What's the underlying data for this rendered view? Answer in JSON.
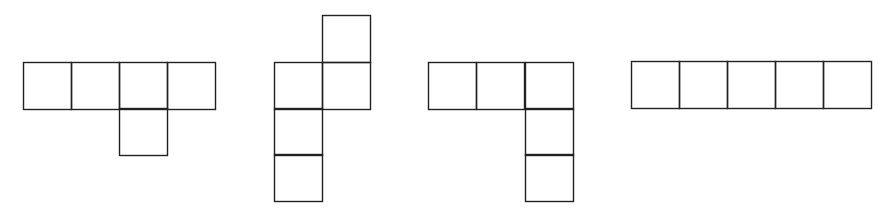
{
  "diagram": {
    "title": "",
    "stroke_color": "#222222",
    "background": "#ffffff",
    "cell_size": 48,
    "figures": [
      {
        "id": "figure-1",
        "shape": "row of four with one square below third",
        "cells": [
          [
            23,
            62
          ],
          [
            71,
            62
          ],
          [
            119,
            62
          ],
          [
            167,
            62
          ],
          [
            119,
            108
          ]
        ]
      },
      {
        "id": "figure-2",
        "shape": "stepped column: top square offset right, then two side by side, then two below left",
        "cells": [
          [
            322,
            15
          ],
          [
            274,
            62
          ],
          [
            322,
            62
          ],
          [
            274,
            108
          ],
          [
            274,
            154
          ]
        ]
      },
      {
        "id": "figure-3",
        "shape": "row of three with two squares below the right end (L shape)",
        "cells": [
          [
            428,
            62
          ],
          [
            476,
            62
          ],
          [
            525,
            62
          ],
          [
            525,
            108
          ],
          [
            525,
            154
          ]
        ]
      },
      {
        "id": "figure-4",
        "shape": "straight row of five",
        "cells": [
          [
            631,
            61
          ],
          [
            679,
            61
          ],
          [
            727,
            61
          ],
          [
            775,
            61
          ],
          [
            823,
            61
          ]
        ]
      }
    ]
  }
}
